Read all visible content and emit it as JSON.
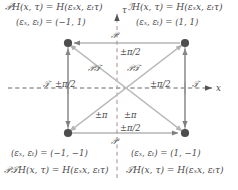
{
  "figure": {
    "type": "symmetry-square-diagram",
    "axes": {
      "x_label": "x",
      "t_label": "τ",
      "horizontal_dashed": true,
      "vertical_dashed": true
    },
    "corners": [
      {
        "id": "top-left",
        "equation": "𝒫H(x, τ) = H(εₓx, εₜτ)",
        "parity_pair": "(εₓ, εₜ) = (−1, 1)",
        "eps_x": -1,
        "eps_t": 1
      },
      {
        "id": "top-right",
        "equation": "ℐH(x, τ) = H(εₓx, εₜτ)",
        "parity_pair": "(εₓ, εₜ) = (1, 1)",
        "eps_x": 1,
        "eps_t": 1
      },
      {
        "id": "bottom-left",
        "equation": "𝒫𝒯H(x, τ) = H(εₓx, εₜτ)",
        "parity_pair": "(εₓ, εₜ) = (−1, −1)",
        "eps_x": -1,
        "eps_t": -1
      },
      {
        "id": "bottom-right",
        "equation": "𝒯H(x, τ) = H(εₓx, εₜτ)",
        "parity_pair": "(εₓ, εₜ) = (1, −1)",
        "eps_x": 1,
        "eps_t": -1
      }
    ],
    "edges": [
      {
        "id": "top",
        "operator": "𝒫",
        "phase": "±π/2"
      },
      {
        "id": "bottom",
        "operator": "𝒫",
        "phase": "±π/2"
      },
      {
        "id": "left",
        "operator": "𝒯",
        "phase": "±π/2"
      },
      {
        "id": "right",
        "operator": "𝒯",
        "phase": "±π/2"
      },
      {
        "id": "diagonal-upper-left",
        "operator": "𝒫𝒯",
        "phase": "±π"
      },
      {
        "id": "diagonal-upper-right",
        "operator": "𝒫𝒯",
        "phase": "±π"
      }
    ],
    "labels": {
      "op_P_top": "𝒫",
      "op_P_bottom": "𝒫",
      "op_T_left": "𝒯",
      "op_T_right": "𝒯",
      "op_PT_left": "𝒫𝒯",
      "op_PT_right": "𝒫𝒯",
      "phase_top": "±π/2",
      "phase_bottom": "±π/2",
      "phase_left": "±π/2",
      "phase_right": "±π/2",
      "phase_diag_left": "±π",
      "phase_diag_right": "±π"
    },
    "colors": {
      "node": "#4d4d4d",
      "edge": "#8a8a8a",
      "diagonal": "#b3b3b3",
      "dashed_axis": "#555555",
      "dashed_vertical": "#b9a0a0",
      "text": "#4a4a4a",
      "background": "#ffffff"
    }
  }
}
